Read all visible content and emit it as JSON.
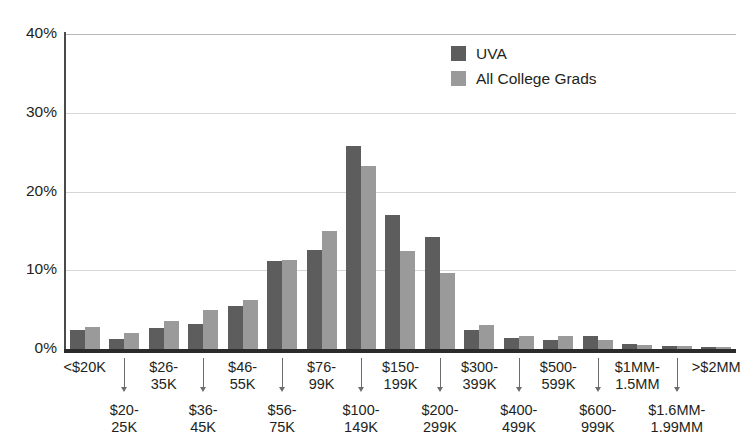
{
  "chart_data": {
    "type": "bar",
    "title": "",
    "xlabel": "",
    "ylabel": "",
    "ylim": [
      0,
      40
    ],
    "ytick_labels": [
      "0%",
      "10%",
      "20%",
      "30%",
      "40%"
    ],
    "ytick_values": [
      0,
      10,
      20,
      30,
      40
    ],
    "grid": true,
    "legend_position": "top-right",
    "categories": [
      "<$20K",
      "$20-25K",
      "$26-35K",
      "$36-45K",
      "$46-55K",
      "$56-75K",
      "$76-99K",
      "$100-149K",
      "$150-199K",
      "$200-299K",
      "$300-399K",
      "$400-499K",
      "$500-599K",
      "$600-999K",
      "$1MM-1.5MM",
      "$1.6MM-1.99MM",
      ">$2MM"
    ],
    "category_lines": [
      [
        "<$20K"
      ],
      [
        "$20-",
        "25K"
      ],
      [
        "$26-",
        "35K"
      ],
      [
        "$36-",
        "45K"
      ],
      [
        "$46-",
        "55K"
      ],
      [
        "$56-",
        "75K"
      ],
      [
        "$76-",
        "99K"
      ],
      [
        "$100-",
        "149K"
      ],
      [
        "$150-",
        "199K"
      ],
      [
        "$200-",
        "299K"
      ],
      [
        "$300-",
        "399K"
      ],
      [
        "$400-",
        "499K"
      ],
      [
        "$500-",
        "599K"
      ],
      [
        "$600-",
        "999K"
      ],
      [
        "$1MM-",
        "1.5MM"
      ],
      [
        "$1.6MM-",
        "1.99MM"
      ],
      [
        ">$2MM"
      ]
    ],
    "series": [
      {
        "name": "UVA",
        "color": "#5d5d5d",
        "values": [
          2.4,
          1.3,
          2.7,
          3.2,
          5.5,
          11.2,
          12.6,
          25.8,
          17.0,
          14.2,
          2.4,
          1.4,
          1.1,
          1.6,
          0.7,
          0.4,
          0.3
        ]
      },
      {
        "name": "All College Grads",
        "color": "#9a9a9a",
        "values": [
          2.8,
          2.0,
          3.6,
          5.0,
          6.2,
          11.3,
          15.0,
          23.2,
          12.5,
          9.7,
          3.1,
          1.7,
          1.6,
          1.2,
          0.5,
          0.4,
          0.3
        ]
      }
    ]
  },
  "legend": {
    "items": [
      {
        "label": "UVA",
        "color": "#5d5d5d"
      },
      {
        "label": "All College Grads",
        "color": "#9a9a9a"
      }
    ]
  }
}
